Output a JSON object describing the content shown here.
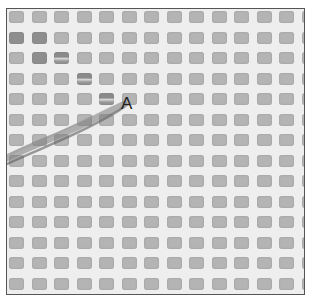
{
  "image": {
    "description": "Grayscale close-up photograph of a woven mesh with square gray openings separated by white threads; a thin fiber streak crosses diagonally from lower left to the labeled point",
    "label": "A",
    "grid": {
      "columns": 14,
      "rows": 14,
      "spacing_x": 22.5,
      "spacing_y": 20.5
    },
    "colors": {
      "thread": "#eeeeee",
      "cell": "#b4b4b4",
      "cell_dark": "#8e8e8e",
      "frame": "#555555",
      "streak": "#6a6a6a",
      "label": "#222222"
    },
    "dark_cells": [
      [
        1,
        0
      ],
      [
        1,
        1
      ],
      [
        2,
        1
      ],
      [
        2,
        2
      ],
      [
        3,
        3
      ],
      [
        4,
        4
      ]
    ]
  }
}
